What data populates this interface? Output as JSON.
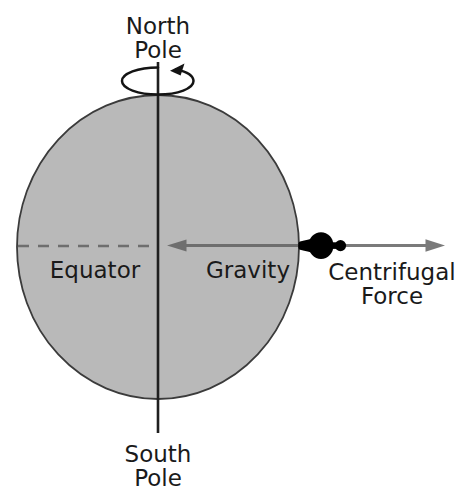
{
  "diagram": {
    "background_color": "#ffffff",
    "labels": {
      "north_pole_line1": "North",
      "north_pole_line2": "Pole",
      "south_pole_line1": "South",
      "south_pole_line2": "Pole",
      "equator": "Equator",
      "gravity": "Gravity",
      "centrifugal_line1": "Centrifugal",
      "centrifugal_line2": "Force"
    },
    "colors": {
      "earth_fill": "#b9b9b9",
      "earth_stroke": "#3b3b3b",
      "axis": "#1f1f1f",
      "gravity_arrow": "#6e6e6e",
      "centrifugal_arrow": "#7a7a7a",
      "equator_dash": "#6e6e6e",
      "person": "#000000",
      "text": "#1a1a1a"
    },
    "geometry": {
      "earth_center_x": 158,
      "earth_center_y": 247,
      "earth_radius_x": 142,
      "earth_radius_y": 152,
      "axis_top_y": 62,
      "axis_bottom_y": 433,
      "equator_y": 246,
      "rotation_ellipse_rx": 36,
      "rotation_ellipse_ry": 14,
      "rotation_ellipse_cy": 81,
      "gravity_arrow_tip_x": 168,
      "gravity_arrow_tail_x": 305,
      "centrifugal_arrow_tail_x": 330,
      "centrifugal_arrow_tip_x": 444,
      "person_x": 315,
      "person_y": 246
    },
    "elements": [
      {
        "name": "earth-sphere",
        "type": "ellipse",
        "description": "gray filled Earth"
      },
      {
        "name": "rotation-axis",
        "type": "line",
        "description": "vertical polar axis"
      },
      {
        "name": "rotation-direction-arrow",
        "type": "curved-arrow",
        "description": "spin direction around north pole"
      },
      {
        "name": "equator-line",
        "type": "dashed-line",
        "description": "equator across Earth"
      },
      {
        "name": "gravity-vector",
        "type": "arrow",
        "direction": "inward-left"
      },
      {
        "name": "centrifugal-vector",
        "type": "arrow",
        "direction": "outward-right"
      },
      {
        "name": "person-on-equator",
        "type": "silhouette"
      }
    ]
  }
}
